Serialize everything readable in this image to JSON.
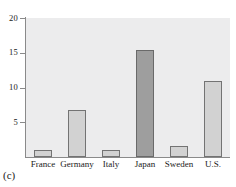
{
  "chart_data": {
    "type": "bar",
    "title": "",
    "subtitle": "",
    "xlabel": "",
    "ylabel": "",
    "categories": [
      "France",
      "Germany",
      "Italy",
      "Japan",
      "Sweden",
      "U.S."
    ],
    "values": [
      1.0,
      6.8,
      1.0,
      15.4,
      1.6,
      11.0
    ],
    "ylim": [
      0,
      20
    ],
    "yticks": [
      5,
      10,
      15,
      20
    ],
    "ytick_labels": [
      "5",
      "10",
      "15",
      "20"
    ],
    "grid": false,
    "legend": null,
    "bar_colors": [
      "#d2d2d2",
      "#d2d2d2",
      "#d2d2d2",
      "#9e9e9e",
      "#d2d2d2",
      "#d2d2d2"
    ],
    "highlighted_category": "Japan",
    "plot_background": "#ececed",
    "bar_edge_color": "#737373",
    "axis_color": "#8a8a8a",
    "annotations": []
  },
  "caption": {
    "label": "(c)"
  }
}
